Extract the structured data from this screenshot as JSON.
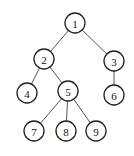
{
  "diagram": {
    "type": "tree",
    "nodes": [
      {
        "id": "1",
        "label": "1",
        "x": 75,
        "y": 23
      },
      {
        "id": "2",
        "label": "2",
        "x": 44,
        "y": 59
      },
      {
        "id": "3",
        "label": "3",
        "x": 114,
        "y": 61
      },
      {
        "id": "4",
        "label": "4",
        "x": 27,
        "y": 93
      },
      {
        "id": "5",
        "label": "5",
        "x": 68,
        "y": 91
      },
      {
        "id": "6",
        "label": "6",
        "x": 114,
        "y": 95
      },
      {
        "id": "7",
        "label": "7",
        "x": 34,
        "y": 131
      },
      {
        "id": "8",
        "label": "8",
        "x": 66,
        "y": 131
      },
      {
        "id": "9",
        "label": "9",
        "x": 96,
        "y": 131
      }
    ],
    "edges": [
      {
        "from": "1",
        "to": "2"
      },
      {
        "from": "1",
        "to": "3"
      },
      {
        "from": "2",
        "to": "4"
      },
      {
        "from": "2",
        "to": "5"
      },
      {
        "from": "3",
        "to": "6"
      },
      {
        "from": "5",
        "to": "7"
      },
      {
        "from": "5",
        "to": "8"
      },
      {
        "from": "5",
        "to": "9"
      }
    ],
    "node_radius": 10
  }
}
